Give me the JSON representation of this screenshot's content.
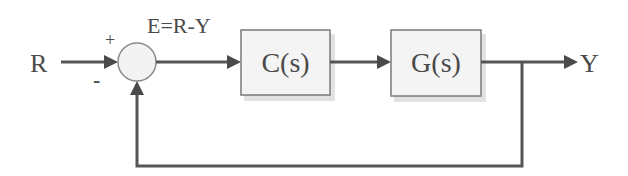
{
  "diagram": {
    "type": "feedback-control-block-diagram",
    "input": {
      "label": "R"
    },
    "output": {
      "label": "Y"
    },
    "summing_junction": {
      "plus_sign": "+",
      "minus_sign": "-",
      "error_label": "E=R-Y"
    },
    "blocks": [
      {
        "id": "controller",
        "label": "C(s)"
      },
      {
        "id": "plant",
        "label": "G(s)"
      }
    ],
    "feedback": {
      "type": "unity negative feedback",
      "from": "Y",
      "to": "summing_junction"
    },
    "colors": {
      "line": "#555555",
      "text": "#4a4a4a",
      "block_fill": "#f4f4f4",
      "block_border": "#7a7a7a",
      "circle_fill": "#f3f3f3"
    }
  }
}
